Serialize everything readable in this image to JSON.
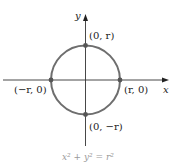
{
  "figure": {
    "axes": {
      "x_label": "x",
      "y_label": "y"
    },
    "circle": {
      "color": "#6e6e6e",
      "point_color": "#555555"
    },
    "points": [
      {
        "id": "top",
        "label": "(0, r)"
      },
      {
        "id": "right",
        "label": "(r, 0)"
      },
      {
        "id": "bottom",
        "label": "(0, −r)"
      },
      {
        "id": "left",
        "label": "(−r, 0)"
      }
    ],
    "equation": "x² + y² = r²"
  }
}
